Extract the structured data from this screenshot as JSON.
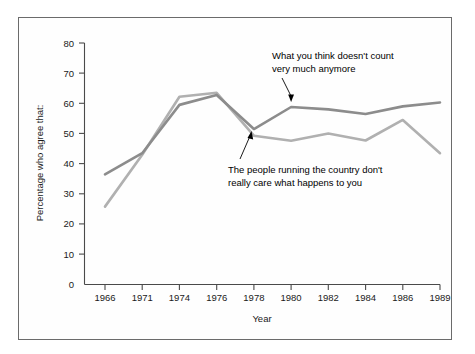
{
  "chart_data": {
    "type": "line",
    "title": "",
    "xlabel": "Year",
    "ylabel": "Percentage who agree that:",
    "categories": [
      "1966",
      "1971",
      "1974",
      "1976",
      "1978",
      "1980",
      "1982",
      "1984",
      "1986",
      "1989"
    ],
    "ylim": [
      0,
      80
    ],
    "yticks": [
      0,
      10,
      20,
      30,
      40,
      50,
      60,
      70,
      80
    ],
    "grid": false,
    "legend_position": "inline-annotations",
    "series": [
      {
        "name": "What you think doesn't count very much anymore",
        "color": "#8c8c8c",
        "values": [
          36.5,
          43.5,
          59.5,
          62.8,
          51.5,
          58.8,
          58.0,
          56.5,
          59.0,
          60.3
        ]
      },
      {
        "name": "The people running the country don't really care what happens to you",
        "color": "#b0b0b0",
        "values": [
          25.8,
          43.0,
          62.2,
          63.5,
          49.3,
          47.6,
          50.0,
          47.7,
          54.5,
          43.5
        ]
      }
    ],
    "annotations": [
      {
        "id": "upper-annotation",
        "line1": "What you think doesn't count",
        "line2": "very much anymore"
      },
      {
        "id": "lower-annotation",
        "line1": "The people running the country don't",
        "line2": "really care what happens to you"
      }
    ]
  },
  "axis": {
    "y_tick_labels": [
      "80",
      "70",
      "60",
      "50",
      "40",
      "30",
      "20",
      "10",
      "0"
    ],
    "x_tick_labels": [
      "1966",
      "1971",
      "1974",
      "1976",
      "1978",
      "1980",
      "1982",
      "1984",
      "1986",
      "1989"
    ],
    "y_title": "Percentage who agree that:",
    "x_title": "Year"
  },
  "colors": {
    "series_dark": "#8c8c8c",
    "series_light": "#b0b0b0",
    "axis": "#4a4a4a",
    "frame": "#6b6b6b",
    "text": "#1a1a1a",
    "background": "#ffffff"
  }
}
